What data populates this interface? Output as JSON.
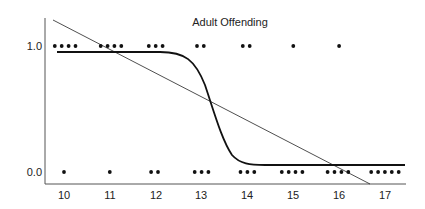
{
  "chart_data": {
    "type": "scatter",
    "title": "Adult Offending",
    "xlabel": "",
    "ylabel": "",
    "x_ticks": [
      "10",
      "11",
      "12",
      "13",
      "14",
      "15",
      "16",
      "17"
    ],
    "y_ticks": [
      "0.0",
      "1.0"
    ],
    "xlim": [
      9.6,
      17.4
    ],
    "ylim": [
      -0.1,
      1.15
    ],
    "grid": false,
    "legend": null,
    "series": [
      {
        "name": "Observed offending = 1",
        "kind": "points",
        "x": [
          9.8,
          9.95,
          10.1,
          10.25,
          10.8,
          10.95,
          11.1,
          11.25,
          11.85,
          12.0,
          12.15,
          12.9,
          13.05,
          13.9,
          14.05,
          15.0,
          16.0
        ],
        "y": [
          1,
          1,
          1,
          1,
          1,
          1,
          1,
          1,
          1,
          1,
          1,
          1,
          1,
          1,
          1,
          1,
          1
        ]
      },
      {
        "name": "Observed offending = 0",
        "kind": "points",
        "x": [
          10.0,
          11.0,
          11.9,
          12.05,
          12.85,
          13.0,
          13.15,
          13.85,
          14.0,
          14.15,
          14.75,
          14.9,
          15.05,
          15.2,
          15.75,
          15.9,
          16.05,
          16.2,
          16.7,
          16.85,
          17.0,
          17.15,
          17.3
        ],
        "y": [
          0,
          0,
          0,
          0,
          0,
          0,
          0,
          0,
          0,
          0,
          0,
          0,
          0,
          0,
          0,
          0,
          0,
          0,
          0,
          0,
          0,
          0,
          0
        ]
      },
      {
        "name": "Linear fit",
        "kind": "line",
        "x": [
          9.8,
          16.7
        ],
        "y": [
          1.2,
          -0.1
        ]
      },
      {
        "name": "Logistic fit",
        "kind": "curve",
        "x": [
          9.9,
          10.5,
          11.0,
          11.5,
          12.0,
          12.3,
          12.5,
          12.7,
          12.9,
          13.1,
          13.3,
          13.6,
          14.0,
          14.5,
          15.0,
          16.0,
          17.3
        ],
        "y": [
          0.95,
          0.95,
          0.95,
          0.949,
          0.93,
          0.88,
          0.79,
          0.6,
          0.38,
          0.2,
          0.11,
          0.06,
          0.05,
          0.05,
          0.05,
          0.05,
          0.05
        ]
      }
    ]
  }
}
